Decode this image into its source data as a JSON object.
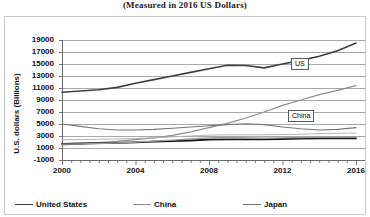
{
  "chart_title": "(Measured in 2016 US Dollars)",
  "axes": {
    "y_axis_title": "U.S. dollars (Billions)",
    "y_ticks": [
      "19000",
      "17000",
      "15000",
      "13000",
      "11000",
      "9000",
      "7000",
      "5000",
      "3000",
      "1000",
      "-1000"
    ],
    "x_ticks": [
      "2000",
      "2004",
      "2008",
      "2012",
      "2016"
    ]
  },
  "annotations": [
    {
      "name": "us-tag",
      "label": "US"
    },
    {
      "name": "china-tag",
      "label": "China"
    }
  ],
  "legend": {
    "rows": [
      [
        {
          "label": "United States",
          "color": "#3f3f3f",
          "width": 1.6
        },
        {
          "label": "China",
          "color": "#8c8c8c",
          "width": 1.2
        },
        {
          "label": "Japan",
          "color": "#777777",
          "width": 1.1
        }
      ],
      [
        {
          "label": "Germany",
          "color": "#b5b5b5",
          "width": 1.0
        },
        {
          "label": "France",
          "color": "#141414",
          "width": 1.8
        },
        {
          "label": "United Kingdom",
          "color": "#9a9a9a",
          "width": 1.3
        }
      ]
    ]
  },
  "chart_data": {
    "type": "line",
    "title": "(Measured in 2016 US Dollars)",
    "xlabel": "",
    "ylabel": "U.S. dollars (Billions)",
    "xlim": [
      2000,
      2016
    ],
    "ylim": [
      -1000,
      19000
    ],
    "y_tick_step": 2000,
    "grid": true,
    "legend_position": "bottom",
    "x": [
      2000,
      2001,
      2002,
      2003,
      2004,
      2005,
      2006,
      2007,
      2008,
      2009,
      2010,
      2011,
      2012,
      2013,
      2014,
      2015,
      2016
    ],
    "series": [
      {
        "name": "United States",
        "color": "#3f3f3f",
        "width": 1.6,
        "values": [
          10300,
          10500,
          10700,
          11100,
          11800,
          12400,
          13000,
          13600,
          14200,
          14800,
          14750,
          14350,
          15000,
          15600,
          16300,
          17200,
          18500
        ]
      },
      {
        "name": "China",
        "color": "#8c8c8c",
        "width": 1.2,
        "values": [
          1500,
          1700,
          1900,
          2100,
          2400,
          2700,
          3100,
          3700,
          4400,
          5100,
          6000,
          7000,
          8100,
          9000,
          9900,
          10600,
          11400
        ]
      },
      {
        "name": "Japan",
        "color": "#777777",
        "width": 1.1,
        "values": [
          5000,
          4600,
          4200,
          4000,
          4000,
          4100,
          4300,
          4500,
          4700,
          4900,
          5050,
          4900,
          4500,
          4200,
          4000,
          4100,
          4400
        ]
      },
      {
        "name": "Germany",
        "color": "#b5b5b5",
        "width": 1.0,
        "values": [
          2400,
          2400,
          2450,
          2500,
          2600,
          2700,
          2850,
          3000,
          3150,
          3200,
          3200,
          3200,
          3250,
          3300,
          3400,
          3450,
          3500
        ]
      },
      {
        "name": "France",
        "color": "#141414",
        "width": 1.8,
        "values": [
          1700,
          1750,
          1800,
          1850,
          1950,
          2050,
          2150,
          2250,
          2400,
          2450,
          2450,
          2450,
          2500,
          2550,
          2600,
          2600,
          2600
        ]
      },
      {
        "name": "United Kingdom",
        "color": "#9a9a9a",
        "width": 1.3,
        "values": [
          1650,
          1700,
          1750,
          1850,
          2000,
          2150,
          2300,
          2500,
          2700,
          2750,
          2700,
          2650,
          2700,
          2750,
          2800,
          2850,
          2900
        ]
      }
    ]
  }
}
